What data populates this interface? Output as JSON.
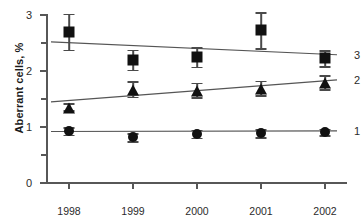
{
  "chart_data": {
    "type": "line",
    "title": "",
    "xlabel": "",
    "ylabel": "Aberrant cells, %",
    "categories": [
      "1998",
      "1999",
      "2000",
      "2001",
      "2002"
    ],
    "ylim": [
      0,
      3
    ],
    "yticks": [
      0,
      1,
      2,
      3
    ],
    "yminorticks": [
      0.5,
      1.5,
      2.5
    ],
    "ytick_labels": [
      "0",
      "1",
      "2",
      "3"
    ],
    "grid": false,
    "legend_position": "right-inline",
    "series": [
      {
        "name": "1",
        "marker": "circle",
        "label": "1",
        "values": [
          0.93,
          0.82,
          0.88,
          0.89,
          0.91
        ],
        "errors": [
          0.07,
          0.07,
          0.07,
          0.07,
          0.06
        ],
        "trend_start": 0.92,
        "trend_end": 0.93
      },
      {
        "name": "2",
        "marker": "triangle",
        "label": "2",
        "values": [
          1.36,
          1.68,
          1.66,
          1.7,
          1.8
        ],
        "errors": [
          0.06,
          0.14,
          0.13,
          0.13,
          0.13
        ],
        "trend_start": 1.45,
        "trend_end": 1.84
      },
      {
        "name": "3",
        "marker": "square",
        "label": "3",
        "values": [
          2.7,
          2.2,
          2.25,
          2.73,
          2.23
        ],
        "errors": [
          0.32,
          0.18,
          0.17,
          0.32,
          0.14
        ],
        "trend_start": 2.52,
        "trend_end": 2.29
      }
    ],
    "colors": {
      "marker": "#111111",
      "axis": "#575757",
      "trend_line": "#555555",
      "error_bar": "#4a4a4a",
      "text": "#2b2b2b",
      "background": "#ffffff"
    }
  }
}
